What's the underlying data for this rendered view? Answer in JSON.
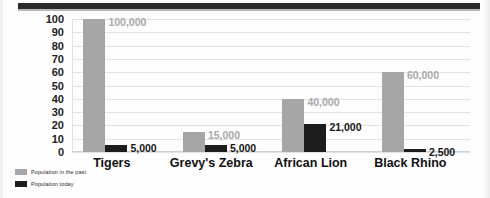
{
  "chart_data": {
    "type": "bar",
    "title": "",
    "xlabel": "",
    "ylabel": "Thousands of Animals",
    "ylim": [
      0,
      100
    ],
    "yticks": [
      100,
      90,
      80,
      70,
      60,
      50,
      40,
      30,
      20,
      10,
      0
    ],
    "grid": true,
    "legend_position": "bottom-left",
    "categories": [
      "Tigers",
      "Grevy's Zebra",
      "African Lion",
      "Black Rhino"
    ],
    "series": [
      {
        "name": "Population in the past",
        "color": "#a6a6a6",
        "values": [
          100,
          15,
          40,
          60
        ],
        "labels": [
          "100,000",
          "15,000",
          "40,000",
          "60,000"
        ]
      },
      {
        "name": "Population today",
        "color": "#1c1c1c",
        "values": [
          5,
          5,
          21,
          2.5
        ],
        "labels": [
          "5,000",
          "5,000",
          "21,000",
          "2,500"
        ]
      }
    ]
  },
  "legend": {
    "items": [
      {
        "label": "Population in the past",
        "color": "#a6a6a6"
      },
      {
        "label": "Population today",
        "color": "#1c1c1c"
      }
    ]
  }
}
